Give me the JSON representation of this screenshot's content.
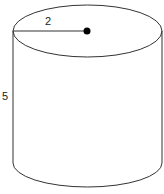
{
  "diagram": {
    "type": "cylinder",
    "radius_label": "2",
    "height_label": "5",
    "stroke_color": "#333333",
    "center_dot_color": "#000000"
  }
}
